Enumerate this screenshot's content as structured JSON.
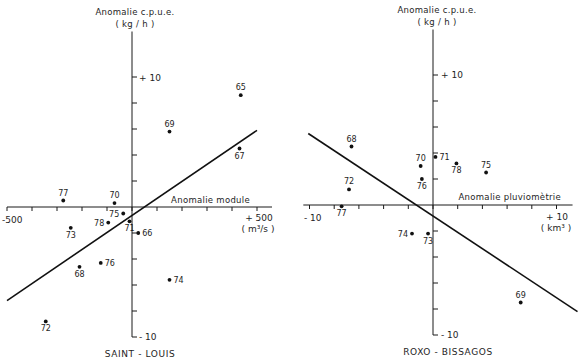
{
  "figure": {
    "panels": [
      {
        "caption": "SAINT - LOUIS",
        "y_title": "Anomalie c.p.u.e.",
        "y_unit": "( kg / h )",
        "y_max_label": "+ 10",
        "y_min_label": "- 10",
        "x_title": "Anomalie  module",
        "x_min_label": "-500",
        "x_max_label": "+ 500",
        "x_unit": "( m³/s )"
      },
      {
        "caption": "ROXO - BISSAGOS",
        "y_title": "Anomalie c.p.u.e.",
        "y_unit": "( kg / h )",
        "y_max_label": "+ 10",
        "y_min_label": "- 10",
        "x_title": "Anomalie  pluviomètrie",
        "x_min_label": "- 10",
        "x_max_label": "+ 10",
        "x_unit": "( km³ )"
      }
    ]
  },
  "chart_data": [
    {
      "type": "scatter",
      "title": "SAINT - LOUIS",
      "xlabel": "Anomalie module",
      "xunit": "m³/s",
      "ylabel": "Anomalie c.p.u.e.",
      "yunit": "kg/h",
      "xlim": [
        -500,
        500
      ],
      "ylim": [
        -10,
        10
      ],
      "x_ticks": {
        "start": -500,
        "end": 500,
        "step": 100
      },
      "y_ticks": {
        "start": -10,
        "end": 10,
        "step": 2
      },
      "axis_extent": {
        "x": [
          -500,
          560
        ],
        "y": [
          -10,
          13.5
        ]
      },
      "grid": false,
      "points": [
        {
          "label": "65",
          "x": 435,
          "y": 8.6,
          "label_pos": "above"
        },
        {
          "label": "69",
          "x": 150,
          "y": 5.8,
          "label_pos": "above"
        },
        {
          "label": "67",
          "x": 430,
          "y": 4.5,
          "label_pos": "below"
        },
        {
          "label": "77",
          "x": -275,
          "y": 0.5,
          "label_pos": "above"
        },
        {
          "label": "70",
          "x": -70,
          "y": 0.3,
          "label_pos": "above"
        },
        {
          "label": "75",
          "x": -35,
          "y": -0.5,
          "label_pos": "left"
        },
        {
          "label": "78",
          "x": -95,
          "y": -1.2,
          "label_pos": "left"
        },
        {
          "label": "71",
          "x": -10,
          "y": -1.1,
          "label_pos": "below"
        },
        {
          "label": "73",
          "x": -245,
          "y": -1.6,
          "label_pos": "below"
        },
        {
          "label": "66",
          "x": 25,
          "y": -2.0,
          "label_pos": "right"
        },
        {
          "label": "76",
          "x": -125,
          "y": -4.3,
          "label_pos": "right"
        },
        {
          "label": "68",
          "x": -210,
          "y": -4.6,
          "label_pos": "below"
        },
        {
          "label": "74",
          "x": 150,
          "y": -5.6,
          "label_pos": "right"
        },
        {
          "label": "72",
          "x": -345,
          "y": -8.8,
          "label_pos": "below"
        }
      ],
      "regression_line": [
        [
          -500,
          -7.2
        ],
        [
          500,
          5.9
        ]
      ]
    },
    {
      "type": "scatter",
      "title": "ROXO - BISSAGOS",
      "xlabel": "Anomalie pluviomètrie",
      "xunit": "km³",
      "ylabel": "Anomalie c.p.u.e.",
      "yunit": "kg/h",
      "xlim": [
        -10,
        10
      ],
      "ylim": [
        -10,
        10
      ],
      "x_ticks": {
        "start": -10,
        "end": 10,
        "step": 2
      },
      "y_ticks": {
        "start": -10,
        "end": 10,
        "step": 2
      },
      "axis_extent": {
        "x": [
          -10.5,
          11.3
        ],
        "y": [
          -10,
          13.5
        ]
      },
      "grid": false,
      "points": [
        {
          "label": "68",
          "x": -6.6,
          "y": 4.5,
          "label_pos": "above"
        },
        {
          "label": "70",
          "x": -1.0,
          "y": 3.0,
          "label_pos": "above"
        },
        {
          "label": "71",
          "x": 0.2,
          "y": 3.7,
          "label_pos": "right"
        },
        {
          "label": "78",
          "x": 1.9,
          "y": 3.2,
          "label_pos": "below"
        },
        {
          "label": "75",
          "x": 4.3,
          "y": 2.5,
          "label_pos": "above"
        },
        {
          "label": "76",
          "x": -0.9,
          "y": 2.0,
          "label_pos": "below"
        },
        {
          "label": "72",
          "x": -6.8,
          "y": 1.2,
          "label_pos": "above"
        },
        {
          "label": "77",
          "x": -7.4,
          "y": -0.1,
          "label_pos": "below"
        },
        {
          "label": "74",
          "x": -1.7,
          "y": -2.2,
          "label_pos": "left"
        },
        {
          "label": "73",
          "x": -0.4,
          "y": -2.2,
          "label_pos": "below"
        },
        {
          "label": "69",
          "x": 7.1,
          "y": -7.5,
          "label_pos": "above"
        }
      ],
      "regression_line": [
        [
          -10.1,
          5.5
        ],
        [
          11.7,
          -8.2
        ]
      ]
    }
  ]
}
